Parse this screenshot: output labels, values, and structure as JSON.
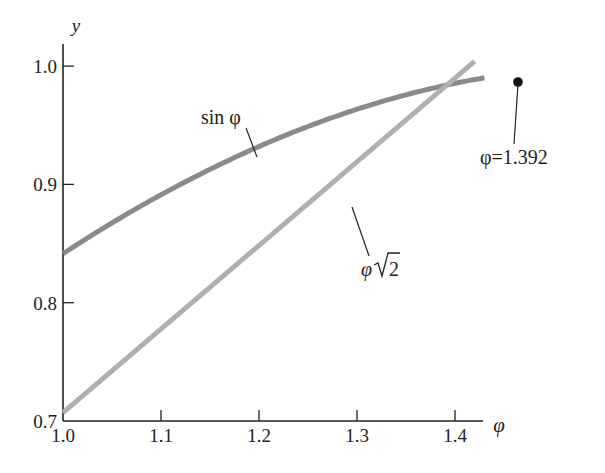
{
  "chart_data": {
    "type": "line",
    "title": "",
    "xlabel": "φ",
    "ylabel": "y",
    "xlim": [
      1.0,
      1.43
    ],
    "ylim": [
      0.7,
      1.02
    ],
    "grid": false,
    "x_ticks": [
      "1.0",
      "1.1",
      "1.2",
      "1.3",
      "1.4"
    ],
    "y_ticks": [
      "0.7",
      "0.8",
      "0.9",
      "1.0"
    ],
    "series": [
      {
        "name": "sin φ",
        "label": "sin φ",
        "color": "#8a8a8a",
        "x": [
          1.0,
          1.05,
          1.1,
          1.15,
          1.2,
          1.25,
          1.3,
          1.35,
          1.392,
          1.43
        ],
        "y": [
          0.841,
          0.867,
          0.891,
          0.913,
          0.932,
          0.949,
          0.964,
          0.976,
          0.984,
          0.99
        ]
      },
      {
        "name": "φ√2",
        "label_prefix": "φ",
        "label_radicand": "2",
        "color": "#b0b0b0",
        "x": [
          1.0,
          1.42
        ],
        "y": [
          0.707,
          1.004
        ]
      }
    ],
    "annotations": [
      {
        "text": "φ=1.392",
        "x": 1.392,
        "y": 0.984,
        "marker": "point"
      }
    ]
  }
}
